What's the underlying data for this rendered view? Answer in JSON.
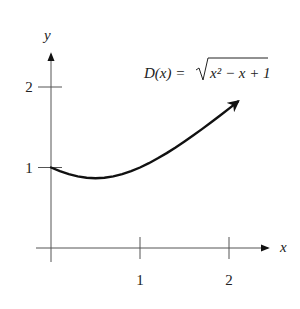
{
  "chart_data": {
    "type": "line",
    "title": "",
    "function_label": {
      "lhs": "D(x) = ",
      "radicand": "x² − x + 1"
    },
    "xlabel": "x",
    "ylabel": "y",
    "x_ticks": [
      {
        "value": 1,
        "label": "1"
      },
      {
        "value": 2,
        "label": "2"
      }
    ],
    "y_ticks": [
      {
        "value": 1,
        "label": "1"
      },
      {
        "value": 2,
        "label": "2"
      }
    ],
    "xlim": [
      0,
      2.1
    ],
    "ylim": [
      0,
      2.0
    ],
    "grid": false,
    "legend": "none",
    "series": [
      {
        "name": "D(x) = sqrt(x^2 - x + 1)",
        "x": [
          0,
          0.1,
          0.2,
          0.3,
          0.4,
          0.5,
          0.6,
          0.7,
          0.8,
          0.9,
          1.0,
          1.1,
          1.2,
          1.3,
          1.4,
          1.5,
          1.6,
          1.7,
          1.8,
          1.9,
          2.0,
          2.1
        ],
        "values": [
          1.0,
          0.954,
          0.917,
          0.889,
          0.872,
          0.866,
          0.872,
          0.889,
          0.917,
          0.954,
          1.0,
          1.054,
          1.114,
          1.179,
          1.249,
          1.323,
          1.4,
          1.48,
          1.562,
          1.646,
          1.732,
          1.819
        ],
        "color": "#111111",
        "end_arrow": true
      }
    ]
  }
}
